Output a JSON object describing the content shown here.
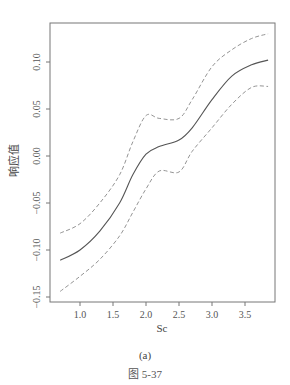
{
  "chart_data": {
    "type": "line",
    "title": "",
    "xlabel": "Sc",
    "ylabel": "响应值",
    "xlim": [
      0.6,
      3.9
    ],
    "ylim": [
      -0.155,
      0.135
    ],
    "xticks": [
      1.0,
      1.5,
      2.0,
      2.5,
      3.0,
      3.5
    ],
    "xtick_labels": [
      "1.0",
      "1.5",
      "2.0",
      "2.5",
      "3.0",
      "3.5"
    ],
    "yticks": [
      0.1,
      0.05,
      0.0,
      -0.05,
      -0.1,
      -0.15
    ],
    "ytick_labels": [
      "0.10",
      "0.05",
      "0.00",
      "−0.05",
      "−0.10",
      "−0.15"
    ],
    "grid": false,
    "legend": null,
    "x": [
      0.7,
      1.0,
      1.3,
      1.6,
      1.8,
      2.0,
      2.2,
      2.5,
      2.7,
      3.0,
      3.3,
      3.6,
      3.85
    ],
    "series": [
      {
        "name": "fit",
        "style": "solid",
        "values": [
          -0.111,
          -0.1,
          -0.08,
          -0.05,
          -0.02,
          0.002,
          0.01,
          0.017,
          0.03,
          0.06,
          0.085,
          0.097,
          0.102
        ]
      },
      {
        "name": "upper",
        "style": "dashed",
        "values": [
          -0.082,
          -0.072,
          -0.05,
          -0.02,
          0.015,
          0.043,
          0.04,
          0.04,
          0.06,
          0.095,
          0.113,
          0.125,
          0.13
        ]
      },
      {
        "name": "lower",
        "style": "dashed",
        "values": [
          -0.144,
          -0.128,
          -0.11,
          -0.085,
          -0.06,
          -0.035,
          -0.016,
          -0.017,
          0.005,
          0.03,
          0.055,
          0.073,
          0.074
        ]
      }
    ]
  },
  "caption": {
    "subfigure": "(a)",
    "figure": "图 5-37"
  },
  "colors": {
    "line": "#555555",
    "dashed": "#888888",
    "axis": "#666666"
  }
}
